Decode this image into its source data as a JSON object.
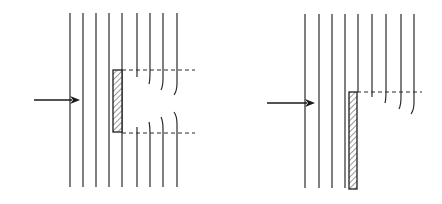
{
  "diagram": {
    "colors": {
      "line": "#2b2b2b",
      "background": "#ffffff",
      "hatch": "#555555"
    },
    "figures": [
      {
        "id": "left",
        "name": "slit-obstacle-figure",
        "arrow": {
          "x1": 34,
          "x2": 80,
          "y": 100
        },
        "straight_lines": [
          {
            "x": 70,
            "y1": 13,
            "y2": 187
          },
          {
            "x": 83,
            "y1": 13,
            "y2": 187
          },
          {
            "x": 96,
            "y1": 13,
            "y2": 187
          },
          {
            "x": 109,
            "y1": 13,
            "y2": 187
          },
          {
            "x": 122,
            "y1": 13,
            "y2": 187
          }
        ],
        "obstacle": {
          "x": 113,
          "y": 70,
          "width": 9,
          "height": 62
        },
        "dashed_lines": [
          {
            "x1": 122,
            "x2": 195,
            "y": 70
          },
          {
            "x1": 122,
            "x2": 195,
            "y": 133
          }
        ],
        "upper_curved_lines": [
          {
            "x": 137,
            "y1": 13,
            "y2": 77,
            "bend": 0
          },
          {
            "x": 150,
            "y1": 13,
            "y2": 84,
            "bend": -1
          },
          {
            "x": 163,
            "y1": 13,
            "y2": 90,
            "bend": -2
          },
          {
            "x": 177,
            "y1": 13,
            "y2": 95,
            "bend": -3
          }
        ],
        "lower_curved_lines": [
          {
            "x": 137,
            "y1": 127,
            "y2": 187,
            "bend": 0
          },
          {
            "x": 150,
            "y1": 122,
            "y2": 187,
            "bend": -1
          },
          {
            "x": 163,
            "y1": 117,
            "y2": 187,
            "bend": -2
          },
          {
            "x": 177,
            "y1": 112,
            "y2": 187,
            "bend": -3
          }
        ]
      },
      {
        "id": "right",
        "name": "edge-obstacle-figure",
        "arrow": {
          "x1": 267,
          "x2": 315,
          "y": 103
        },
        "straight_lines": [
          {
            "x": 305,
            "y1": 14,
            "y2": 188
          },
          {
            "x": 319,
            "y1": 14,
            "y2": 188
          },
          {
            "x": 332,
            "y1": 14,
            "y2": 188
          },
          {
            "x": 345,
            "y1": 14,
            "y2": 188
          },
          {
            "x": 358,
            "y1": 14,
            "y2": 92
          }
        ],
        "obstacle": {
          "x": 349,
          "y": 92,
          "width": 8,
          "height": 97
        },
        "dashed_lines": [
          {
            "x1": 357,
            "x2": 422,
            "y": 92
          }
        ],
        "upper_curved_lines": [
          {
            "x": 372,
            "y1": 14,
            "y2": 97,
            "bend": 0
          },
          {
            "x": 386,
            "y1": 14,
            "y2": 103,
            "bend": -1
          },
          {
            "x": 401,
            "y1": 14,
            "y2": 109,
            "bend": -2
          },
          {
            "x": 414,
            "y1": 14,
            "y2": 114,
            "bend": -3
          }
        ],
        "lower_curved_lines": []
      }
    ]
  }
}
